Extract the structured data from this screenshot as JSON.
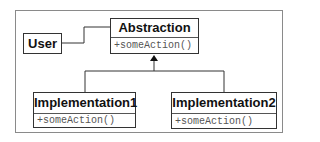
{
  "diagram": {
    "classes": {
      "user": {
        "name": "User"
      },
      "abstraction": {
        "name": "Abstraction",
        "operations": [
          "+someAction()"
        ]
      },
      "implementation1": {
        "name": "Implementation1",
        "operations": [
          "+someAction()"
        ]
      },
      "implementation2": {
        "name": "Implementation2",
        "operations": [
          "+someAction()"
        ]
      }
    },
    "relations": [
      {
        "type": "association",
        "from": "User",
        "to": "Abstraction"
      },
      {
        "type": "generalization",
        "from": "Implementation1",
        "to": "Abstraction"
      },
      {
        "type": "generalization",
        "from": "Implementation2",
        "to": "Abstraction"
      }
    ],
    "colors": {
      "line": "#333333",
      "frame": "#8a8a8a",
      "operation_text": "#555555"
    }
  }
}
